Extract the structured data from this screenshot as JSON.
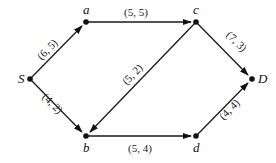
{
  "diagram": {
    "type": "directed-flow-network",
    "nodes": [
      {
        "id": "S",
        "label": "S",
        "x": 30,
        "y": 79
      },
      {
        "id": "a",
        "label": "a",
        "x": 86,
        "y": 22
      },
      {
        "id": "c",
        "label": "c",
        "x": 196,
        "y": 22
      },
      {
        "id": "D",
        "label": "D",
        "x": 252,
        "y": 79
      },
      {
        "id": "b",
        "label": "b",
        "x": 86,
        "y": 136
      },
      {
        "id": "d",
        "label": "d",
        "x": 196,
        "y": 136
      }
    ],
    "edges": [
      {
        "from": "S",
        "to": "a",
        "label": "(6, 5)"
      },
      {
        "from": "a",
        "to": "c",
        "label": "(5, 5)"
      },
      {
        "from": "c",
        "to": "D",
        "label": "(7, 3)"
      },
      {
        "from": "S",
        "to": "b",
        "label": "(4, 2)"
      },
      {
        "from": "c",
        "to": "b",
        "label": "(5, 2)"
      },
      {
        "from": "b",
        "to": "d",
        "label": "(5, 4)"
      },
      {
        "from": "d",
        "to": "D",
        "label": "(4, 4)"
      }
    ]
  }
}
